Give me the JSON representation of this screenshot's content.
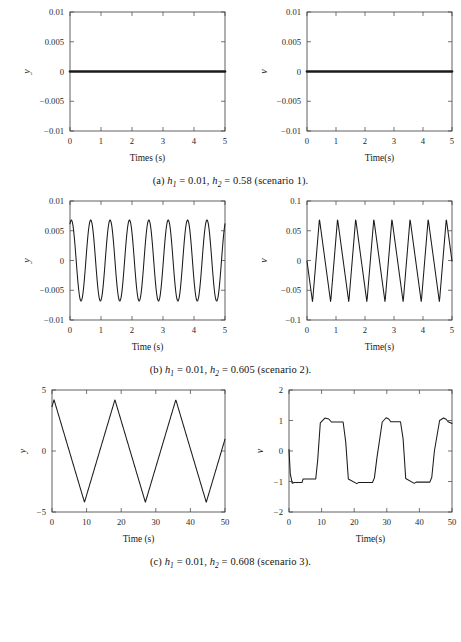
{
  "figure": {
    "background": "#ffffff",
    "line_color": "#1b1b1b",
    "axis_color": "#3b3b3b",
    "panels": [
      {
        "id": "a",
        "caption_prefix": "(a)",
        "caption_h1": "0.01",
        "caption_h2": "0.58",
        "caption_scenario": "(scenario 1).",
        "caption_full": "(a) h1 = 0.01, h2 = 0.58 (scenario 1)."
      },
      {
        "id": "b",
        "caption_prefix": "(b)",
        "caption_h1": "0.01",
        "caption_h2": "0.605",
        "caption_scenario": "(scenario 2).",
        "caption_full": "(b) h1 = 0.01, h2 = 0.605 (scenario 2)."
      },
      {
        "id": "c",
        "caption_prefix": "(c)",
        "caption_h1": "0.01",
        "caption_h2": "0.608",
        "caption_scenario": "(scenario 3).",
        "caption_full": "(c) h1 = 0.01, h2 = 0.608 (scenario 3)."
      }
    ],
    "symbols": {
      "h": "h",
      "one": "1",
      "two": "2",
      "equals": "=",
      "comma": ",",
      "sep": " "
    }
  },
  "chart_data": [
    {
      "id": "a-left",
      "type": "line",
      "title": "",
      "xlabel": "Times (s)",
      "ylabel": "y",
      "xlim": [
        0,
        5
      ],
      "ylim": [
        -0.01,
        0.01
      ],
      "xticks": [
        0,
        1,
        2,
        3,
        4,
        5
      ],
      "xticklabels": [
        "0",
        "1",
        "2",
        "3",
        "4",
        "5"
      ],
      "yticks": [
        -0.01,
        -0.005,
        0,
        0.005,
        0.01
      ],
      "yticklabels": [
        "-0.01",
        "-0.005",
        "0",
        "0.005",
        "0.01"
      ],
      "grid": false,
      "legend": null,
      "series": [
        {
          "name": "y",
          "note": "flat at zero (settled), drawn thick",
          "thick": true,
          "x": [
            0,
            0.25,
            0.5,
            0.75,
            1,
            1.25,
            1.5,
            1.75,
            2,
            2.25,
            2.5,
            2.75,
            3,
            3.25,
            3.5,
            3.75,
            4,
            4.25,
            4.5,
            4.75,
            5
          ],
          "values": [
            0,
            0,
            0,
            0,
            0,
            0,
            0,
            0,
            0,
            0,
            0,
            0,
            0,
            0,
            0,
            0,
            0,
            0,
            0,
            0,
            0
          ]
        }
      ]
    },
    {
      "id": "a-right",
      "type": "line",
      "title": "",
      "xlabel": "Time(s)",
      "ylabel": "v",
      "xlim": [
        0,
        5
      ],
      "ylim": [
        -0.01,
        0.01
      ],
      "xticks": [
        0,
        1,
        2,
        3,
        4,
        5
      ],
      "xticklabels": [
        "0",
        "1",
        "2",
        "3",
        "4",
        "5"
      ],
      "yticks": [
        -0.01,
        -0.005,
        0,
        0.005,
        0.01
      ],
      "yticklabels": [
        "-0.01",
        "-0.005",
        "0",
        "0.005",
        "0.01"
      ],
      "grid": false,
      "legend": null,
      "series": [
        {
          "name": "v",
          "note": "flat at zero (settled), drawn thick",
          "thick": true,
          "x": [
            0,
            0.25,
            0.5,
            0.75,
            1,
            1.25,
            1.5,
            1.75,
            2,
            2.25,
            2.5,
            2.75,
            3,
            3.25,
            3.5,
            3.75,
            4,
            4.25,
            4.5,
            4.75,
            5
          ],
          "values": [
            0,
            0,
            0,
            0,
            0,
            0,
            0,
            0,
            0,
            0,
            0,
            0,
            0,
            0,
            0,
            0,
            0,
            0,
            0,
            0,
            0
          ]
        }
      ]
    },
    {
      "id": "b-left",
      "type": "line",
      "title": "",
      "xlabel": "Time (s)",
      "ylabel": "y",
      "xlim": [
        0,
        5
      ],
      "ylim": [
        -0.01,
        0.01
      ],
      "xticks": [
        0,
        1,
        2,
        3,
        4,
        5
      ],
      "xticklabels": [
        "0",
        "1",
        "2",
        "3",
        "4",
        "5"
      ],
      "yticks": [
        -0.01,
        -0.005,
        0,
        0.005,
        0.01
      ],
      "yticklabels": [
        "-0.01",
        "-0.005",
        "0",
        "0.005",
        "0.01"
      ],
      "grid": false,
      "legend": null,
      "waveform": {
        "shape": "sine",
        "amplitude": 0.0068,
        "period": 0.625,
        "phase_deg": 65,
        "offset": 0,
        "samples": 400
      },
      "series": [
        {
          "name": "y",
          "note": "limit-cycle oscillation, ~8 cycles over 5 s, amplitude +/-0.0068",
          "thick": false,
          "x": [],
          "values": []
        }
      ]
    },
    {
      "id": "b-right",
      "type": "line",
      "title": "",
      "xlabel": "Time(s)",
      "ylabel": "v",
      "xlim": [
        0,
        5
      ],
      "ylim": [
        -0.1,
        0.1
      ],
      "xticks": [
        0,
        1,
        2,
        3,
        4,
        5
      ],
      "xticklabels": [
        "0",
        "1",
        "2",
        "3",
        "4",
        "5"
      ],
      "yticks": [
        -0.1,
        -0.05,
        0,
        0.05,
        0.1
      ],
      "yticklabels": [
        "-0.1",
        "-0.05",
        "0",
        "0.05",
        "0.1"
      ],
      "grid": false,
      "legend": null,
      "waveform": {
        "shape": "triangle",
        "amplitude": 0.07,
        "period": 0.625,
        "phase_deg": 250,
        "offset": 0,
        "skew": 0.38,
        "samples": 400
      },
      "series": [
        {
          "name": "v",
          "note": "asymmetric triangular wave, ~8 cycles over 5 s, amplitude +/-0.07",
          "thick": false,
          "x": [],
          "values": []
        }
      ]
    },
    {
      "id": "c-left",
      "type": "line",
      "title": "",
      "xlabel": "Time (s)",
      "ylabel": "y",
      "xlim": [
        0,
        50
      ],
      "ylim": [
        -5,
        5
      ],
      "xticks": [
        0,
        10,
        20,
        30,
        40,
        50
      ],
      "xticklabels": [
        "0",
        "10",
        "20",
        "30",
        "40",
        "50"
      ],
      "yticks": [
        -5,
        0,
        5
      ],
      "yticklabels": [
        "-5",
        "0",
        "5"
      ],
      "grid": false,
      "legend": null,
      "waveform": {
        "shape": "triangle",
        "amplitude": 4.2,
        "period": 17.6,
        "phase_deg": 168,
        "offset": 0,
        "skew": 0.5,
        "samples": 600
      },
      "series": [
        {
          "name": "y",
          "note": "triangular wave, ~2.8 cycles over 50 s, amplitude +/-4.2",
          "thick": false,
          "x": [],
          "values": []
        }
      ]
    },
    {
      "id": "c-right",
      "type": "line",
      "title": "",
      "xlabel": "Time(s)",
      "ylabel": "v",
      "xlim": [
        0,
        50
      ],
      "ylim": [
        -2,
        2
      ],
      "xticks": [
        0,
        10,
        20,
        30,
        40,
        50
      ],
      "xticklabels": [
        "0",
        "10",
        "20",
        "30",
        "40",
        "50"
      ],
      "yticks": [
        -2,
        -1,
        0,
        1,
        2
      ],
      "yticklabels": [
        "-2",
        "-1",
        "0",
        "1",
        "2"
      ],
      "grid": false,
      "legend": null,
      "explicit_points": {
        "x": [
          0,
          0.4,
          1.0,
          1.6,
          4.0,
          4.3,
          8.2,
          8.8,
          9.6,
          11.0,
          12.2,
          13.0,
          13.6,
          16.6,
          17.4,
          18.2,
          20.8,
          21.4,
          25.6,
          26.2,
          27.0,
          28.6,
          29.8,
          30.6,
          31.2,
          34.2,
          35.0,
          35.8,
          38.4,
          39.0,
          43.2,
          43.8,
          44.6,
          46.2,
          47.4,
          48.2,
          48.8,
          50
        ],
        "values": [
          0.05,
          -0.75,
          -1.06,
          -1.03,
          -1.03,
          -0.92,
          -0.92,
          -0.3,
          0.92,
          1.08,
          1.05,
          0.95,
          0.95,
          0.95,
          0.3,
          -0.92,
          -1.07,
          -1.03,
          -1.03,
          -0.88,
          -0.2,
          0.95,
          1.09,
          1.05,
          0.96,
          0.96,
          0.4,
          -0.9,
          -1.06,
          -1.02,
          -1.02,
          -0.86,
          0.0,
          1.0,
          1.08,
          1.04,
          0.96,
          0.9
        ]
      },
      "series": [
        {
          "name": "v",
          "note": "square-wave-like switching between -1 and +1 with small plateau steps",
          "thick": false,
          "x": [],
          "values": []
        }
      ]
    }
  ]
}
